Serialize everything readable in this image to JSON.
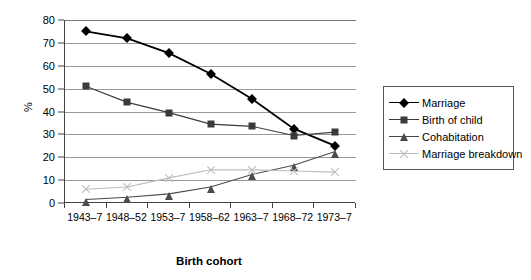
{
  "chart_data": {
    "type": "line",
    "title": "",
    "xlabel": "Birth cohort",
    "ylabel": "%",
    "ylim": [
      0,
      80
    ],
    "ytick_step": 10,
    "yticks": [
      "0",
      "10",
      "20",
      "30",
      "40",
      "50",
      "60",
      "70",
      "80"
    ],
    "grid": true,
    "legend_position": "right",
    "categories": [
      "1943–7",
      "1948–52",
      "1953–7",
      "1958–62",
      "1963–7",
      "1968–72",
      "1973–7"
    ],
    "series": [
      {
        "name": "Marriage",
        "marker": "diamond",
        "color": "#000000",
        "values": [
          75,
          72,
          65.5,
          56.5,
          45.5,
          32.5,
          25
        ]
      },
      {
        "name": "Birth of child",
        "marker": "square",
        "color": "#3a3a3a",
        "values": [
          51,
          44,
          39.5,
          34.5,
          33.5,
          29.5,
          31
        ]
      },
      {
        "name": "Cohabitation",
        "marker": "triangle",
        "color": "#4a4a4a",
        "values": [
          1.5,
          2.5,
          4,
          7,
          12.5,
          16.5,
          22.5
        ]
      },
      {
        "name": "Marriage breakdown",
        "marker": "cross",
        "color": "#bdbdbd",
        "values": [
          6,
          7,
          11,
          14.5,
          14.5,
          14,
          13.5
        ]
      }
    ]
  },
  "legend": {
    "items": [
      {
        "label": "Marriage"
      },
      {
        "label": "Birth of child"
      },
      {
        "label": "Cohabitation"
      },
      {
        "label": "Marriage breakdown"
      }
    ]
  }
}
